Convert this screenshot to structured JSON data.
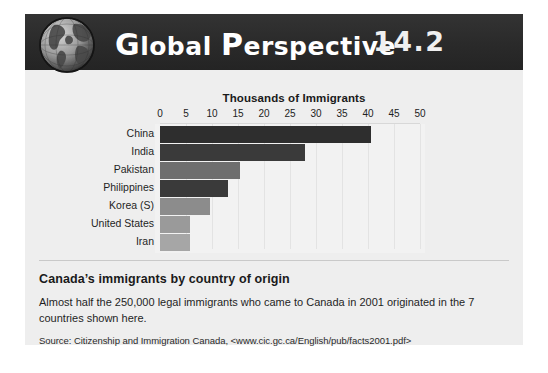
{
  "header": {
    "title_lead": "G",
    "title_word1": "lobal",
    "title_lead2": "P",
    "title_word2": "erspective",
    "number": "14.2",
    "globe_icon": "globe-icon",
    "bar_color": "#2b2b2b"
  },
  "chart_data": {
    "type": "bar",
    "orientation": "horizontal",
    "title": "Thousands of Immigrants",
    "xlabel": "Thousands of Immigrants",
    "ylabel": "",
    "categories": [
      "China",
      "India",
      "Pakistan",
      "Philippines",
      "Korea (S)",
      "United States",
      "Iran"
    ],
    "values": [
      40.5,
      27.8,
      15.3,
      13.1,
      9.6,
      5.8,
      5.7
    ],
    "bar_colors": [
      "#2e2e2e",
      "#3a3a3a",
      "#6e6e6e",
      "#3a3a3a",
      "#8c8c8c",
      "#9a9a9a",
      "#a6a6a6"
    ],
    "xlim": [
      0,
      50
    ],
    "ticks": [
      0,
      5,
      10,
      15,
      20,
      25,
      30,
      35,
      40,
      45,
      50
    ],
    "tick_labels": [
      "0",
      "5",
      "10",
      "15",
      "20",
      "25",
      "30",
      "35",
      "40",
      "45",
      "50"
    ],
    "grid": true,
    "legend": null,
    "plot_background": "#f2f2f2"
  },
  "caption": {
    "heading": "Canada’s immigrants by country of origin",
    "body": "Almost half the 250,000 legal immigrants who came to Canada in 2001 originated in the 7 countries shown here.",
    "source": "Source: Citizenship and Immigration Canada, <www.cic.gc.ca/English/pub/facts2001.pdf>"
  }
}
